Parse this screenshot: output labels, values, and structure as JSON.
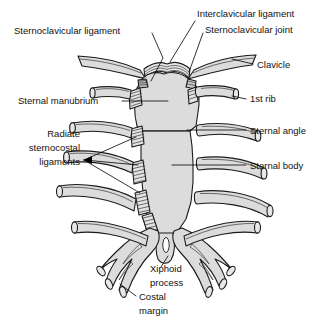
{
  "figure": {
    "background_color": "#ffffff",
    "bone_fill_color": "#dcdcdc",
    "outline_color": "#1a1a1a",
    "label_color": "#111111"
  },
  "labels": {
    "sternoclavicular_ligament": "Sternoclavicular ligament",
    "interclavicular_ligament": "Interclavicular ligament",
    "sternoclavicular_joint": "Sternoclavicular joint",
    "clavicle": "Clavicle",
    "sternal_manubrium": "Sternal manubrium",
    "first_rib": "1st rib",
    "sternal_angle": "Sternal angle",
    "sternal_body": "Sternal body",
    "radiate_line1": "Radiate",
    "radiate_line2": "sternocostal",
    "radiate_line3": "ligaments",
    "xiphoid_line1": "Xiphoid",
    "xiphoid_line2": "process",
    "costal_line1": "Costal",
    "costal_line2": "margin"
  },
  "structures": [
    {
      "name": "clavicle-left",
      "type": "bone"
    },
    {
      "name": "clavicle-right",
      "type": "bone"
    },
    {
      "name": "manubrium",
      "type": "bone"
    },
    {
      "name": "sternal-body",
      "type": "bone"
    },
    {
      "name": "xiphoid-process",
      "type": "bone"
    },
    {
      "name": "first-rib-left",
      "type": "cartilage"
    },
    {
      "name": "first-rib-right",
      "type": "cartilage"
    },
    {
      "name": "second-rib-left",
      "type": "cartilage"
    },
    {
      "name": "second-rib-right",
      "type": "cartilage"
    },
    {
      "name": "third-rib-left",
      "type": "cartilage"
    },
    {
      "name": "third-rib-right",
      "type": "cartilage"
    },
    {
      "name": "fourth-rib-left",
      "type": "cartilage"
    },
    {
      "name": "fourth-rib-right",
      "type": "cartilage"
    },
    {
      "name": "fifth-rib-left",
      "type": "cartilage"
    },
    {
      "name": "fifth-rib-right",
      "type": "cartilage"
    },
    {
      "name": "costal-margin-left",
      "type": "cartilage"
    },
    {
      "name": "costal-margin-right",
      "type": "cartilage"
    },
    {
      "name": "interclavicular-ligament",
      "type": "ligament"
    },
    {
      "name": "radiate-sternocostal-ligaments",
      "type": "ligament"
    }
  ]
}
